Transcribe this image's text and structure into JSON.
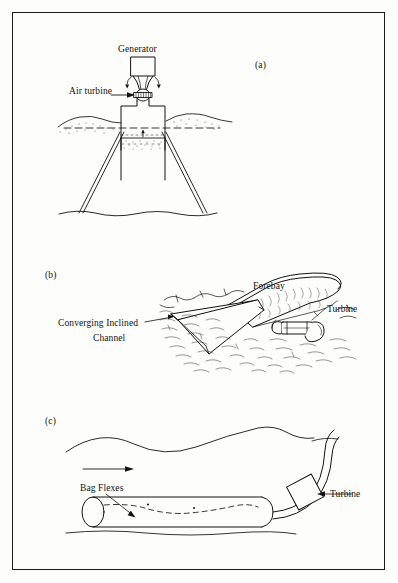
{
  "figure": {
    "border_color": "#1a1a1a",
    "background_color": "#fdfdfb",
    "ink_color": "#121212",
    "panels": [
      {
        "id": "a",
        "letter": "(a)",
        "name": "oscillating-water-column",
        "labels": [
          {
            "name": "generator",
            "text": "Generator"
          },
          {
            "name": "air-turbine",
            "text": "Air turbine"
          }
        ]
      },
      {
        "id": "b",
        "letter": "(b)",
        "name": "tapered-channel-forebay",
        "labels": [
          {
            "name": "forebay",
            "text": "Forebay"
          },
          {
            "name": "turbine",
            "text": "Turbine"
          },
          {
            "name": "converging-inclined-line1",
            "text": "Converging Inclined"
          },
          {
            "name": "converging-inclined-line2",
            "text": "Channel"
          }
        ]
      },
      {
        "id": "c",
        "letter": "(c)",
        "name": "flexible-bag-device",
        "labels": [
          {
            "name": "bag-flexes",
            "text": "Bag Flexes"
          },
          {
            "name": "turbine",
            "text": "Turbine"
          }
        ]
      }
    ]
  }
}
